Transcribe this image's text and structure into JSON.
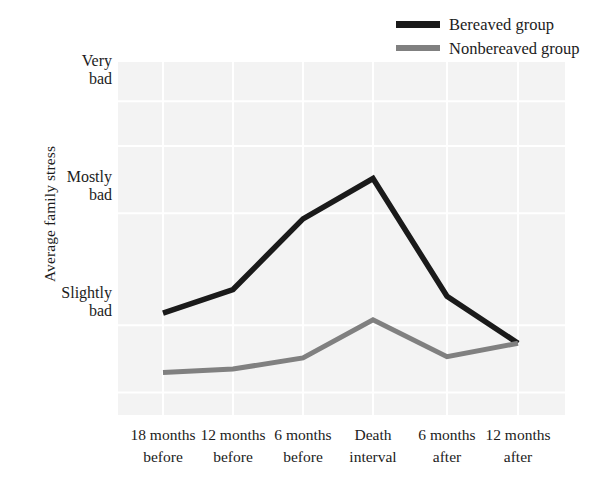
{
  "chart_data": {
    "type": "line",
    "title": "",
    "subtitle": "",
    "xlabel": "",
    "ylabel": "Average family stress",
    "categories": [
      "18 months before",
      "12 months before",
      "6 months before",
      "Death interval",
      "6 months after",
      "12 months after"
    ],
    "x_tick_lines": [
      [
        "18 months",
        "before"
      ],
      [
        "12 months",
        "before"
      ],
      [
        "6 months",
        "before"
      ],
      [
        "Death",
        "interval"
      ],
      [
        "6 months",
        "after"
      ],
      [
        "12 months",
        "after"
      ]
    ],
    "y_tick_labels": [
      "Very bad",
      "Mostly bad",
      "Slightly bad"
    ],
    "y_tick_lines": [
      [
        "Very",
        "bad"
      ],
      [
        "Mostly",
        "bad"
      ],
      [
        "Slightly",
        "bad"
      ]
    ],
    "y_tick_values": [
      3,
      2,
      1
    ],
    "ylim": [
      0.2,
      3.35
    ],
    "grid": true,
    "legend_position": "top-right",
    "series": [
      {
        "name": "Bereaved group",
        "color": "#1a1a1a",
        "values": [
          1.11,
          1.32,
          1.95,
          2.31,
          1.26,
          0.84
        ]
      },
      {
        "name": "Nonbereaved group",
        "color": "#808080",
        "values": [
          0.58,
          0.61,
          0.71,
          1.05,
          0.72,
          0.84
        ]
      }
    ]
  },
  "legend": {
    "items": [
      {
        "label": "Bereaved group",
        "color": "#1a1a1a"
      },
      {
        "label": "Nonbereaved group",
        "color": "#808080"
      }
    ]
  },
  "axes": {
    "y_title": "Average family stress"
  },
  "colors": {
    "bereaved": "#1a1a1a",
    "nonbereaved": "#808080",
    "plot_background": "#f3f3f3",
    "gridline": "#ffffff",
    "text": "#1c1c1c"
  }
}
